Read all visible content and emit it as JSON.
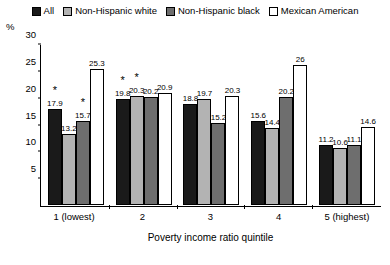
{
  "chart_data": {
    "type": "bar",
    "title": "",
    "xlabel": "Poverty income ratio quintile",
    "ylabel": "%",
    "ylim": [
      0,
      30
    ],
    "yticks": [
      0,
      5,
      10,
      15,
      20,
      25,
      30
    ],
    "grid": false,
    "legend_position": "top",
    "categories": [
      "1 (lowest)",
      "2",
      "3",
      "4",
      "5 (highest)"
    ],
    "series": [
      {
        "name": "All",
        "color": "#1a1a1a",
        "values": [
          17.9,
          19.8,
          18.8,
          15.6,
          11.2
        ],
        "labels": [
          "17.9",
          "19.8",
          "18.8",
          "15.6",
          "11.2"
        ],
        "significance": [
          "*",
          "*",
          "",
          "",
          ""
        ]
      },
      {
        "name": "Non-Hispanic white",
        "color": "#b3b3b3",
        "values": [
          13.2,
          20.3,
          19.7,
          14.4,
          10.6
        ],
        "labels": [
          "13.2",
          "20.3",
          "19.7",
          "14.4",
          "10.6"
        ],
        "significance": [
          "",
          "*",
          "",
          "",
          ""
        ]
      },
      {
        "name": "Non-Hispanic black",
        "color": "#6e6e6e",
        "values": [
          15.7,
          20.2,
          15.2,
          20.2,
          11.1
        ],
        "labels": [
          "15.7",
          "20.2",
          "15.2",
          "20.2",
          "11.1"
        ],
        "significance": [
          "*",
          "",
          "",
          "",
          ""
        ]
      },
      {
        "name": "Mexican American",
        "color": "#ffffff",
        "values": [
          25.3,
          20.9,
          20.3,
          26.0,
          14.6
        ],
        "labels": [
          "25.3",
          "20.9",
          "20.3",
          "26",
          "14.6"
        ],
        "significance": [
          "",
          "",
          "",
          "",
          ""
        ]
      }
    ]
  }
}
